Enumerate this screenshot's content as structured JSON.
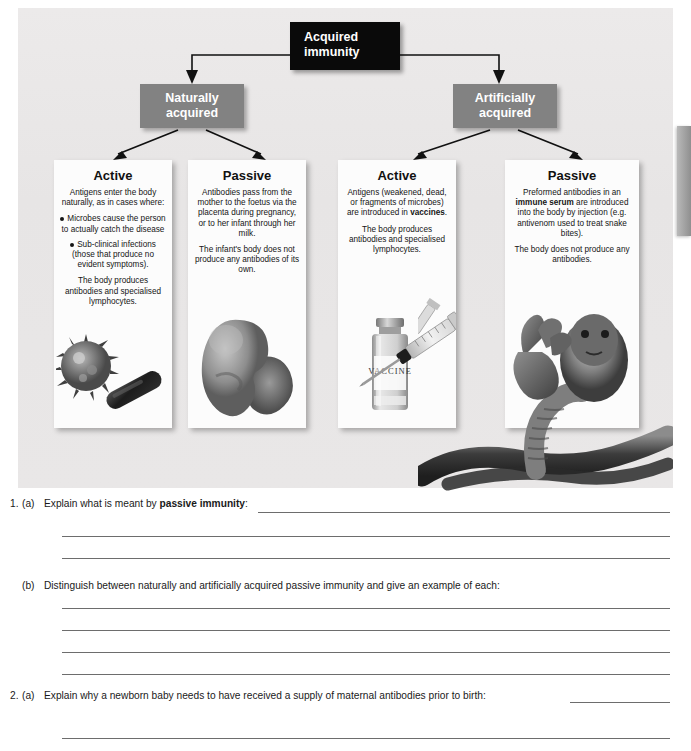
{
  "diagram": {
    "root": {
      "label": "Acquired immunity",
      "line1": "Acquired",
      "line2": "immunity",
      "color": "#0a0a0a"
    },
    "branches": [
      {
        "name": "naturally-acquired",
        "line1": "Naturally",
        "line2": "acquired",
        "color": "#828282"
      },
      {
        "name": "artificially-acquired",
        "line1": "Artificially",
        "line2": "acquired",
        "color": "#828282"
      }
    ],
    "panels": [
      {
        "title": "Active",
        "intro": "Antigens enter the body naturally, as in cases where:",
        "bullets": [
          "Microbes cause the person to actually catch the disease",
          "Sub-clinical infections (those that produce no evident symptoms)."
        ],
        "closing": "The body produces antibodies and specialised lymphocytes.",
        "artwork": "virus-and-bacterium"
      },
      {
        "title": "Passive",
        "intro": "Antibodies pass from the mother to the foetus via the placenta during pregnancy, or to her infant through her milk.",
        "bullets": [],
        "closing": "The infant's body does not produce any antibodies of its own.",
        "artwork": "foetus"
      },
      {
        "title": "Active",
        "intro_pre": "Antigens (weakened, dead, or fragments of microbes) are introduced in ",
        "intro_bold": "vaccines",
        "intro_post": ".",
        "bullets": [],
        "closing": "The body produces antibodies and specialised lymphocytes.",
        "artwork": "vaccine-vial-and-syringe",
        "vial_label": "VACCINE"
      },
      {
        "title": "Passive",
        "intro_pre": "Preformed antibodies in an ",
        "intro_bold": "immune serum",
        "intro_post": " are introduced into the body by injection (e.g. antivenom used to treat snake bites).",
        "bullets": [],
        "closing": "The body does not produce any antibodies.",
        "artwork": "cobra-snake-and-hand"
      }
    ]
  },
  "questions": [
    {
      "number": "1.",
      "letter": "(a)",
      "text_pre": "Explain what is meant by ",
      "text_bold": "passive immunity",
      "text_post": ":",
      "answer_lines": 3
    },
    {
      "number": "",
      "letter": "(b)",
      "text_pre": "Distinguish between naturally and artificially acquired passive immunity and give an example of each:",
      "text_bold": "",
      "text_post": "",
      "answer_lines": 4
    },
    {
      "number": "2.",
      "letter": "(a)",
      "text_pre": "Explain why a newborn baby needs to have received a supply of maternal antibodies prior to birth:",
      "text_bold": "",
      "text_post": "",
      "answer_lines": 1
    }
  ]
}
